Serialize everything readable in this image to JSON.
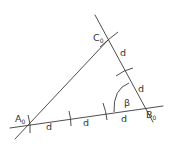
{
  "diagram": {
    "type": "geometric-construction",
    "colors": {
      "line": "#3a3a3a",
      "text": "#333333",
      "background": "#ffffff"
    },
    "points": {
      "A0": {
        "label": "A",
        "subscript": "0",
        "x": 29,
        "y": 124
      },
      "B0": {
        "label": "B",
        "subscript": "0",
        "x": 143,
        "y": 108
      },
      "C0": {
        "label": "C",
        "subscript": "0",
        "x": 108,
        "y": 40
      }
    },
    "angle": {
      "label": "β",
      "at": "B0"
    },
    "segment_labels": {
      "base": [
        "d",
        "d",
        "d"
      ],
      "side_bc": [
        "d",
        "d"
      ]
    }
  }
}
